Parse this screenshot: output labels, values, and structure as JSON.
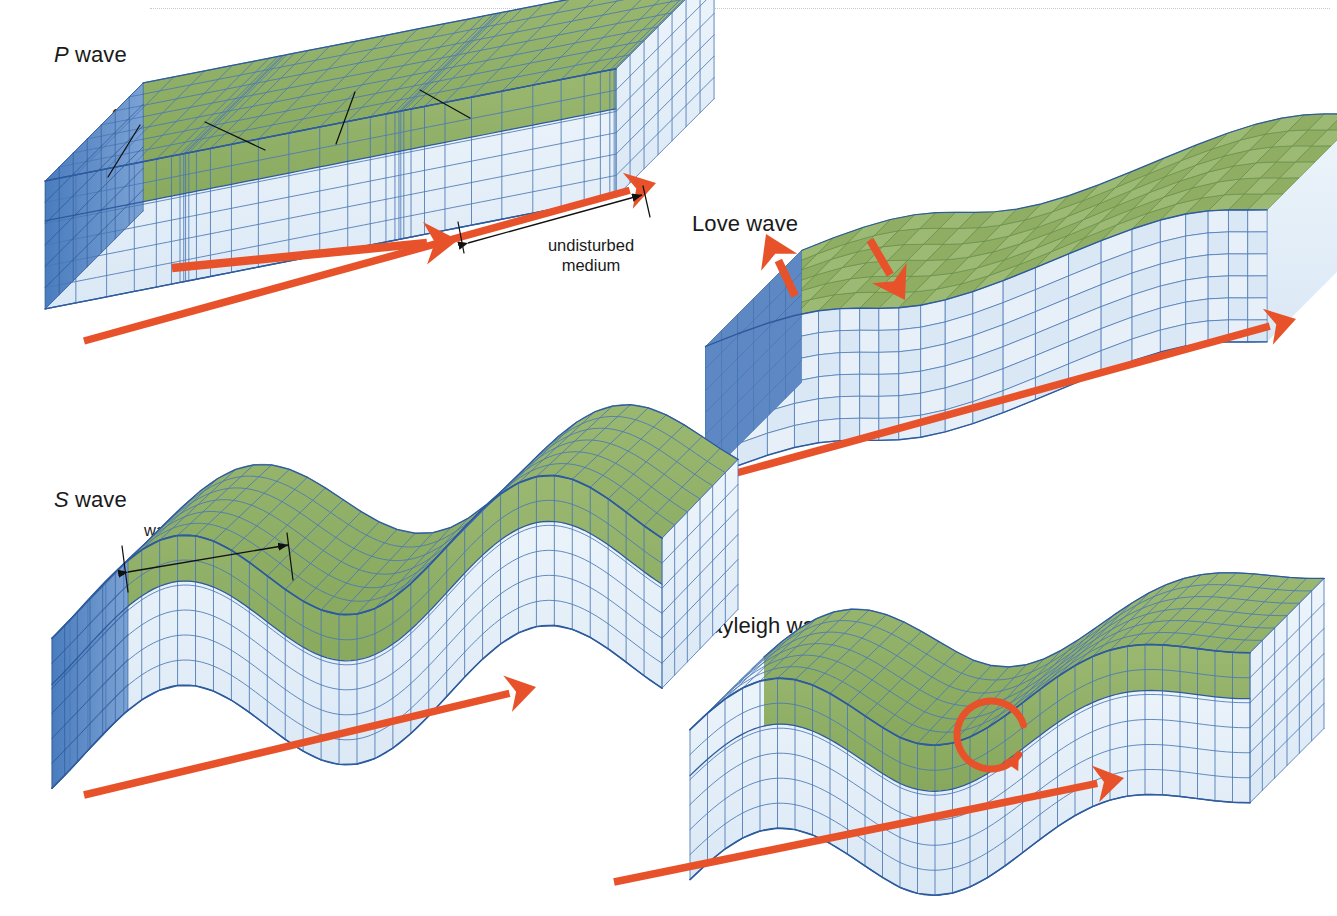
{
  "figure": {
    "kind": "seismic-wave-types-diagram",
    "background": "#ffffff",
    "top_rule": "dotted-hairline"
  },
  "palette": {
    "grid_line": "#2d5b9e",
    "grid_line_light": "#4a77b5",
    "top_green": "#8fae63",
    "top_green_dark": "#7d9e55",
    "side_blue": "#dce9f4",
    "side_blue_light": "#eaf2fa",
    "end_blue": "#4f7fc0",
    "arrow_orange": "#e8522a",
    "text": "#1a1a1a",
    "leader_line": "#111111"
  },
  "panels": [
    {
      "id": "p-wave",
      "title_italic": "P",
      "title_rest": " wave",
      "title_x": 54,
      "title_y": 42,
      "description": "Compressional body wave: straight block with alternating compressed and expanded grid bands on the green surface layer",
      "labels": [
        {
          "name": "expansions-label",
          "text": "expansions",
          "x": 112,
          "y": 103
        },
        {
          "name": "compressions-label",
          "text": "compressions",
          "x": 302,
          "y": 72
        },
        {
          "name": "undisturbed-medium-label",
          "text": "undisturbed",
          "text2": "medium",
          "x": 521,
          "y": 238
        }
      ],
      "propagation_arrow": {
        "name": "p-wave-propagation-arrow",
        "from": [
          84,
          341
        ],
        "to": [
          656,
          183
        ]
      },
      "inner_arrow": {
        "name": "p-wave-inner-arrow",
        "from": [
          172,
          270
        ],
        "to": [
          456,
          240
        ]
      },
      "dimension": {
        "name": "undisturbed-medium-dimension",
        "from": [
          460,
          228
        ],
        "to": [
          645,
          193
        ]
      }
    },
    {
      "id": "love-wave",
      "title_italic": "",
      "title_rest": "Love wave",
      "title_x": 692,
      "title_y": 211,
      "description": "Horizontally polarized surface wave: blocks of cubes sheared side to side transverse to the propagation direction",
      "labels": [],
      "propagation_arrow": {
        "name": "love-wave-propagation-arrow",
        "from": [
          722,
          477
        ],
        "to": [
          1296,
          319
        ]
      },
      "motion_arrows": [
        {
          "name": "love-wave-motion-arrow-up",
          "from": [
            793,
            292
          ],
          "to": [
            767,
            237
          ]
        },
        {
          "name": "love-wave-motion-arrow-down",
          "from": [
            872,
            243
          ],
          "to": [
            903,
            297
          ]
        }
      ]
    },
    {
      "id": "s-wave",
      "title_italic": "S",
      "title_rest": " wave",
      "title_x": 54,
      "title_y": 487,
      "description": "Shear body wave: block surface undulates vertically in a sinusoidal wave train",
      "labels": [
        {
          "name": "wavelength-label",
          "text": "wavelength",
          "x": 144,
          "y": 523
        }
      ],
      "propagation_arrow": {
        "name": "s-wave-propagation-arrow",
        "from": [
          84,
          795
        ],
        "to": [
          534,
          687
        ]
      },
      "dimension": {
        "name": "wavelength-dimension",
        "from": [
          125,
          554
        ],
        "to": [
          290,
          541
        ]
      }
    },
    {
      "id": "rayleigh-wave",
      "title_italic": "",
      "title_rest": "Rayleigh wave",
      "title_x": 694,
      "title_y": 613,
      "description": "Retrograde elliptical surface wave: rolling vertical undulation with a circular particle-motion arrow",
      "labels": [],
      "propagation_arrow": {
        "name": "rayleigh-wave-propagation-arrow",
        "from": [
          614,
          882
        ],
        "to": [
          1122,
          778
        ]
      },
      "circular_arrow": {
        "name": "rayleigh-wave-circular-motion-arrow",
        "center": [
          991,
          735
        ],
        "radius": 34,
        "direction": "counterclockwise"
      }
    }
  ]
}
